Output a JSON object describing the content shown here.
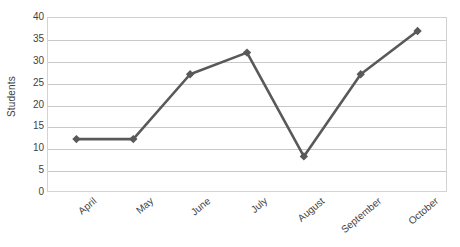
{
  "chart_data": {
    "type": "line",
    "title": "",
    "xlabel": "",
    "ylabel": "Students",
    "categories": [
      "April",
      "May",
      "June",
      "July",
      "August",
      "September",
      "October"
    ],
    "values": [
      12,
      12,
      27,
      32,
      8,
      27,
      37
    ],
    "series": [
      {
        "name": "Students",
        "values": [
          12,
          12,
          27,
          32,
          8,
          27,
          37
        ]
      }
    ],
    "ylim": [
      0,
      40
    ],
    "ytick_labels": [
      "0",
      "5",
      "10",
      "15",
      "20",
      "25",
      "30",
      "35",
      "40"
    ],
    "ytick_values": [
      0,
      5,
      10,
      15,
      20,
      25,
      30,
      35,
      40
    ],
    "grid": true,
    "legend": "none",
    "marker": "diamond",
    "colors": {
      "line": "#595959",
      "marker": "#595959",
      "gridline": "#c9c9c9",
      "axis_border": "#d3d3d3",
      "text": "#3f3f3f",
      "background": "#ffffff"
    }
  }
}
